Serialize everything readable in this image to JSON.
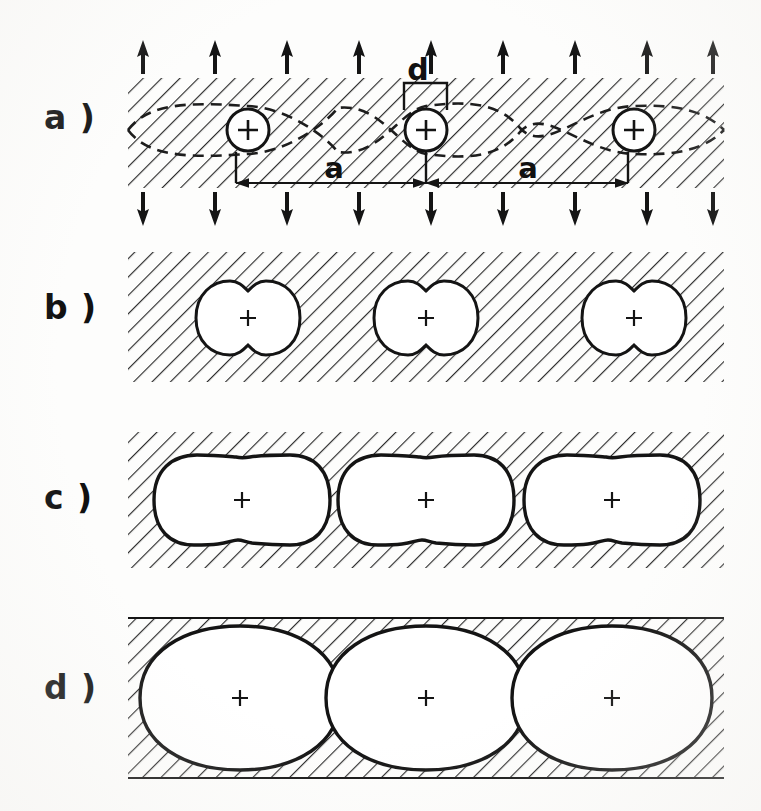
{
  "figure": {
    "background_color": "#fdfdfc",
    "ink_color": "#161616",
    "panel_count": 4
  },
  "panels": [
    {
      "id": "a",
      "label": "a )",
      "description": "Hatched matrix band with three circular atom sites, dashed sinusoidal grain-boundary curves, applied-stress arrows above and below, dimension annotations",
      "frame": {
        "x": 128,
        "y": 78,
        "width": 596,
        "height": 110
      },
      "shape_kind": "circle",
      "sites": [
        {
          "cx": 248,
          "cy": 130,
          "r": 22,
          "marker": "+"
        },
        {
          "cx": 426,
          "cy": 130,
          "r": 22,
          "marker": "+"
        },
        {
          "cx": 634,
          "cy": 130,
          "r": 22,
          "marker": "+"
        }
      ]
    },
    {
      "id": "b",
      "label": "b )",
      "description": "Hatched matrix band with three small peanut-shaped cavities with cusps",
      "frame": {
        "x": 128,
        "y": 252,
        "width": 596,
        "height": 130
      },
      "shape_kind": "peanut",
      "sites": [
        {
          "cx": 248,
          "cy": 318,
          "marker": "+"
        },
        {
          "cx": 426,
          "cy": 318,
          "marker": "+"
        },
        {
          "cx": 634,
          "cy": 318,
          "marker": "+"
        }
      ]
    },
    {
      "id": "c",
      "label": "c )",
      "description": "Hatched matrix band with three enlarged stadium-shaped cavities",
      "frame": {
        "x": 128,
        "y": 432,
        "width": 596,
        "height": 136
      },
      "shape_kind": "stadium",
      "sites": [
        {
          "cx": 242,
          "cy": 500,
          "marker": "+"
        },
        {
          "cx": 426,
          "cy": 500,
          "marker": "+"
        },
        {
          "cx": 612,
          "cy": 500,
          "marker": "+"
        }
      ]
    },
    {
      "id": "d",
      "label": "d )",
      "description": "Hatched matrix band with three large lenticular cavities nearly coalescing, leaving thin hatched wedges",
      "frame": {
        "x": 128,
        "y": 618,
        "width": 596,
        "height": 160
      },
      "shape_kind": "lens",
      "sites": [
        {
          "cx": 240,
          "cy": 698,
          "marker": "+"
        },
        {
          "cx": 426,
          "cy": 698,
          "marker": "+"
        },
        {
          "cx": 612,
          "cy": 698,
          "marker": "+"
        }
      ]
    }
  ],
  "annotations": {
    "spacing_label": "a",
    "spacing_label_positions": [
      {
        "x": 334,
        "y": 168
      },
      {
        "x": 528,
        "y": 168
      }
    ],
    "thickness_label": "d",
    "thickness_label_position": {
      "x": 418,
      "y": 74
    },
    "dimension_line": {
      "y": 183,
      "x_start": 236,
      "x_end": 628,
      "ticks": [
        236,
        426,
        628
      ],
      "arrowheads": [
        "left",
        "center-both",
        "right"
      ]
    },
    "atom_marker": "+",
    "stress_arrows": {
      "top_direction": "up",
      "bottom_direction": "down",
      "count": 9,
      "top_y": 46,
      "bottom_y": 196,
      "x_positions": [
        143,
        215,
        287,
        359,
        431,
        503,
        575,
        647,
        713
      ]
    },
    "boundary_curve_style": "dashed-sinusoid",
    "boundary_curve_count": 2
  },
  "style": {
    "hatch_angle_deg": 45,
    "hatch_spacing_px": 13,
    "hatch_stroke_width": 2.2,
    "hatch_color": "#2b2b2b",
    "outline_color": "#141414",
    "outline_width": 3,
    "dashed_color": "#1d1d1d"
  }
}
